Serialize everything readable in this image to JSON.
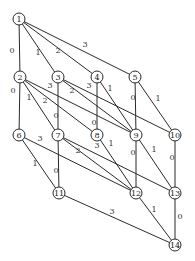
{
  "diagram": {
    "nodes": [
      {
        "id": "1",
        "x": 19,
        "y": 19
      },
      {
        "id": "2",
        "x": 20,
        "y": 77
      },
      {
        "id": "3",
        "x": 58,
        "y": 77
      },
      {
        "id": "4",
        "x": 97,
        "y": 77
      },
      {
        "id": "5",
        "x": 135,
        "y": 77
      },
      {
        "id": "6",
        "x": 19,
        "y": 135
      },
      {
        "id": "7",
        "x": 58,
        "y": 135
      },
      {
        "id": "8",
        "x": 97,
        "y": 135
      },
      {
        "id": "9",
        "x": 136,
        "y": 135
      },
      {
        "id": "10",
        "x": 175,
        "y": 135
      },
      {
        "id": "11",
        "x": 59,
        "y": 193
      },
      {
        "id": "12",
        "x": 136,
        "y": 193
      },
      {
        "id": "13",
        "x": 175,
        "y": 193
      },
      {
        "id": "14",
        "x": 175,
        "y": 245
      }
    ],
    "edges": [
      {
        "from": "1",
        "to": "2",
        "label": "0",
        "lx": 12,
        "ly": 50
      },
      {
        "from": "1",
        "to": "3",
        "label": "1",
        "lx": 38,
        "ly": 52
      },
      {
        "from": "1",
        "to": "4",
        "label": "2",
        "lx": 58,
        "ly": 50
      },
      {
        "from": "1",
        "to": "5",
        "label": "3",
        "lx": 85,
        "ly": 44
      },
      {
        "from": "2",
        "to": "6",
        "label": "0",
        "lx": 13,
        "ly": 90
      },
      {
        "from": "2",
        "to": "7",
        "label": "1",
        "lx": 29,
        "ly": 97
      },
      {
        "from": "2",
        "to": "8",
        "label": "2",
        "lx": 45,
        "ly": 100
      },
      {
        "from": "2",
        "to": "9",
        "label": "3",
        "lx": 50,
        "ly": 85
      },
      {
        "from": "3",
        "to": "7",
        "label": "0",
        "lx": 56,
        "ly": 115
      },
      {
        "from": "3",
        "to": "9",
        "label": "2",
        "lx": 72,
        "ly": 90
      },
      {
        "from": "3",
        "to": "10",
        "label": "3",
        "lx": 89,
        "ly": 85
      },
      {
        "from": "4",
        "to": "8",
        "label": "0",
        "lx": 94,
        "ly": 122
      },
      {
        "from": "4",
        "to": "9",
        "label": "1",
        "lx": 110,
        "ly": 88
      },
      {
        "from": "5",
        "to": "9",
        "label": "0",
        "lx": 133,
        "ly": 97
      },
      {
        "from": "5",
        "to": "10",
        "label": "1",
        "lx": 158,
        "ly": 98
      },
      {
        "from": "6",
        "to": "11",
        "label": "1",
        "lx": 35,
        "ly": 163
      },
      {
        "from": "6",
        "to": "12",
        "label": "3",
        "lx": 40,
        "ly": 138
      },
      {
        "from": "7",
        "to": "11",
        "label": "0",
        "lx": 56,
        "ly": 170
      },
      {
        "from": "7",
        "to": "12",
        "label": "2",
        "lx": 78,
        "ly": 150
      },
      {
        "from": "7",
        "to": "13",
        "label": "3",
        "lx": 97,
        "ly": 145
      },
      {
        "from": "8",
        "to": "12",
        "label": "1",
        "lx": 111,
        "ly": 143
      },
      {
        "from": "9",
        "to": "12",
        "label": "0",
        "lx": 133,
        "ly": 152
      },
      {
        "from": "9",
        "to": "13",
        "label": "1",
        "lx": 154,
        "ly": 149
      },
      {
        "from": "10",
        "to": "13",
        "label": "0",
        "lx": 172,
        "ly": 157
      },
      {
        "from": "11",
        "to": "14",
        "label": "3",
        "lx": 112,
        "ly": 211
      },
      {
        "from": "12",
        "to": "14",
        "label": "1",
        "lx": 154,
        "ly": 209
      },
      {
        "from": "13",
        "to": "14",
        "label": "0",
        "lx": 180,
        "ly": 216
      }
    ]
  }
}
